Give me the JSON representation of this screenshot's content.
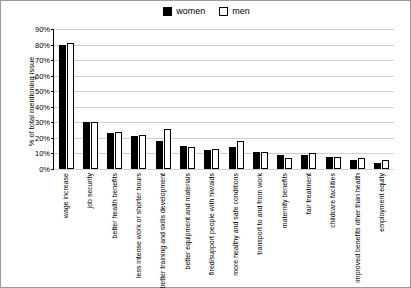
{
  "chart_data": {
    "type": "bar",
    "title": "",
    "xlabel": "",
    "ylabel": "% of total mentioning issue",
    "ylim": [
      0,
      90
    ],
    "ytick_labels": [
      "0%",
      "10%",
      "20%",
      "30%",
      "40%",
      "50%",
      "60%",
      "70%",
      "80%",
      "90%"
    ],
    "ytick_values": [
      0,
      10,
      20,
      30,
      40,
      50,
      60,
      70,
      80,
      90
    ],
    "grid": true,
    "legend_position": "top-center",
    "categories": [
      "wage increase",
      "job security",
      "better health benefits",
      "less intense work or shorter hours",
      "better training and skills development",
      "better equipment and materials",
      "fired/support people with hiv/aids",
      "more healthy and safe conditions",
      "transport to and from work",
      "maternity benefits",
      "fair treatment",
      "childcare facilities",
      "improved benefits other than health",
      "employment equity"
    ],
    "series": [
      {
        "name": "women",
        "color": "#000000",
        "values": [
          80,
          30,
          23,
          21,
          18,
          15,
          12,
          14,
          11,
          9,
          9,
          8,
          6,
          4
        ]
      },
      {
        "name": "men",
        "color": "#ffffff",
        "values": [
          81,
          30,
          24,
          22,
          26,
          14,
          13,
          18,
          11,
          7,
          10,
          8,
          7,
          6
        ]
      }
    ]
  },
  "legend": {
    "entries": [
      {
        "label": "women",
        "swatch": "#000000"
      },
      {
        "label": "men",
        "swatch": "#ffffff"
      }
    ]
  },
  "axes": {
    "y_title": "% of total mentioning issue"
  }
}
